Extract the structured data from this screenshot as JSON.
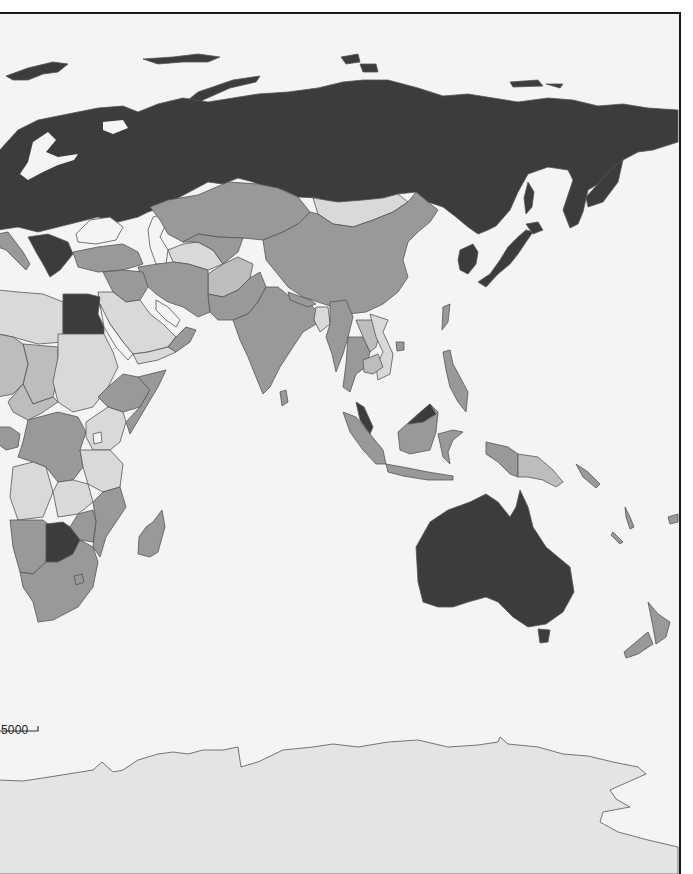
{
  "map": {
    "type": "choropleth",
    "projection": "world, Eurasia-Africa-Oceania section",
    "palette": {
      "ocean": "#f4f4f4",
      "class_1_lightest": "#d9d9d9",
      "class_2_light": "#bdbdbd",
      "class_3_medium": "#999999",
      "class_4_darkest": "#3c3c3c",
      "border": "#555555",
      "antarctica_fill": "#e4e4e4",
      "frame": "#1a1a1a"
    },
    "regions": [
      {
        "name": "Russia",
        "class": "class_4_darkest"
      },
      {
        "name": "Northern/Eastern Europe",
        "class": "class_4_darkest"
      },
      {
        "name": "Kazakhstan",
        "class": "class_3_medium"
      },
      {
        "name": "Mongolia",
        "class": "class_1_lightest"
      },
      {
        "name": "China",
        "class": "class_3_medium"
      },
      {
        "name": "Korea",
        "class": "class_4_darkest"
      },
      {
        "name": "Japan",
        "class": "class_4_darkest"
      },
      {
        "name": "Turkey",
        "class": "class_3_medium"
      },
      {
        "name": "Iran",
        "class": "class_3_medium"
      },
      {
        "name": "Turkmenistan",
        "class": "class_1_lightest"
      },
      {
        "name": "Afghanistan",
        "class": "class_2_light"
      },
      {
        "name": "Pakistan",
        "class": "class_3_medium"
      },
      {
        "name": "India",
        "class": "class_3_medium"
      },
      {
        "name": "Bangladesh",
        "class": "class_1_lightest"
      },
      {
        "name": "Myanmar",
        "class": "class_3_medium"
      },
      {
        "name": "Thailand",
        "class": "class_3_medium"
      },
      {
        "name": "Vietnam",
        "class": "class_1_lightest"
      },
      {
        "name": "Malaysia",
        "class": "class_4_darkest"
      },
      {
        "name": "Indonesia",
        "class": "class_3_medium"
      },
      {
        "name": "Philippines",
        "class": "class_3_medium"
      },
      {
        "name": "Papua New Guinea",
        "class": "class_2_light"
      },
      {
        "name": "Australia",
        "class": "class_4_darkest"
      },
      {
        "name": "New Zealand",
        "class": "class_3_medium"
      },
      {
        "name": "Egypt",
        "class": "class_4_darkest"
      },
      {
        "name": "Libya",
        "class": "class_1_lightest"
      },
      {
        "name": "Saudi Arabia",
        "class": "class_1_lightest"
      },
      {
        "name": "Oman",
        "class": "class_3_medium"
      },
      {
        "name": "Yemen",
        "class": "class_1_lightest"
      },
      {
        "name": "Sudan",
        "class": "class_1_lightest"
      },
      {
        "name": "Chad",
        "class": "class_2_light"
      },
      {
        "name": "Ethiopia",
        "class": "class_3_medium"
      },
      {
        "name": "Somalia",
        "class": "class_3_medium"
      },
      {
        "name": "DR Congo",
        "class": "class_3_medium"
      },
      {
        "name": "Gabon",
        "class": "class_3_medium"
      },
      {
        "name": "Angola",
        "class": "class_1_lightest"
      },
      {
        "name": "Zambia",
        "class": "class_1_lightest"
      },
      {
        "name": "Tanzania",
        "class": "class_1_lightest"
      },
      {
        "name": "Kenya",
        "class": "class_1_lightest"
      },
      {
        "name": "Mozambique",
        "class": "class_3_medium"
      },
      {
        "name": "Zimbabwe",
        "class": "class_3_medium"
      },
      {
        "name": "Namibia",
        "class": "class_3_medium"
      },
      {
        "name": "Botswana",
        "class": "class_4_darkest"
      },
      {
        "name": "South Africa",
        "class": "class_3_medium"
      },
      {
        "name": "Madagascar",
        "class": "class_3_medium"
      },
      {
        "name": "Antarctica",
        "class": "antarctica_fill"
      }
    ]
  },
  "scale_bar": {
    "label": "5000"
  }
}
